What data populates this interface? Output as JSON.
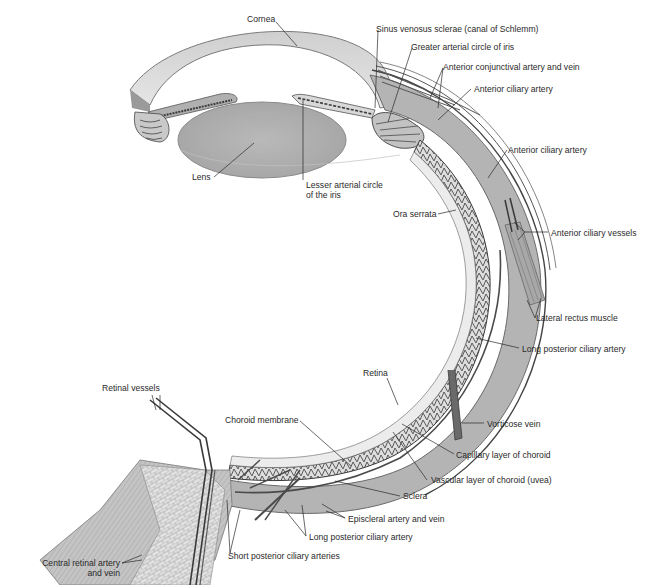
{
  "diagram": {
    "type": "anatomical-illustration",
    "colors": {
      "background": "#ffffff",
      "tissue_light": "#d9d9d9",
      "tissue_mid": "#b8b8b8",
      "tissue_dark": "#8e8e8e",
      "vessel": "#5a5a5a",
      "leader_line": "#2a2a2a",
      "label_text": "#2a2a2a"
    },
    "labels": {
      "cornea": "Cornea",
      "sinus_venosus": "Sinus venosus sclerae (canal of Schlemm)",
      "greater_arterial_circle": "Greater arterial circle of iris",
      "anterior_conjunctival": "Anterior conjunctival artery and vein",
      "anterior_ciliary_artery_1": "Anterior ciliary artery",
      "anterior_ciliary_artery_2": "Anterior ciliary artery",
      "lens": "Lens",
      "lesser_arterial_circle_1": "Lesser arterial circle",
      "lesser_arterial_circle_2": "of the iris",
      "ora_serrata": "Ora serrata",
      "anterior_ciliary_vessels": "Anterior ciliary vessels",
      "lateral_rectus": "Lateral rectus muscle",
      "long_posterior_ciliary_1": "Long posterior ciliary artery",
      "retina": "Retina",
      "retinal_vessels": "Retinal vessels",
      "choroid_membrane": "Choroid membrane",
      "vorticose_vein": "Vorticose vein",
      "capillary_layer": "Capillary layer of choroid",
      "vascular_layer": "Vascular layer of choroid (uvea)",
      "sclera": "Sclera",
      "episcleral": "Episcleral artery and vein",
      "long_posterior_ciliary_2": "Long posterior ciliary artery",
      "short_posterior_ciliary": "Short posterior ciliary arteries",
      "central_retinal_1": "Central retinal artery",
      "central_retinal_2": "and vein"
    }
  }
}
